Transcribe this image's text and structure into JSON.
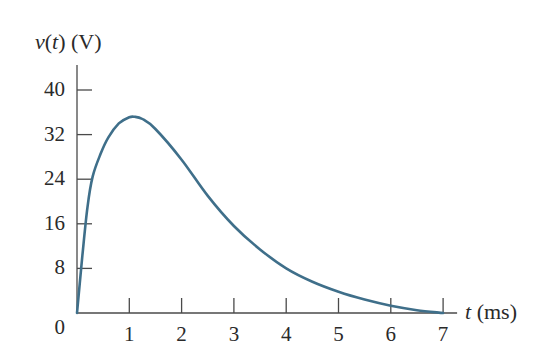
{
  "chart_data": {
    "type": "line",
    "title": "",
    "ylabel": "v(t) (V)",
    "ylabel_var": "v",
    "ylabel_arg": "t",
    "ylabel_unit": "(V)",
    "xlabel": "t (ms)",
    "xlabel_var": "t",
    "xlabel_unit": "(ms)",
    "xlim": [
      0,
      7
    ],
    "ylim": [
      0,
      40
    ],
    "xticks": [
      1,
      2,
      3,
      4,
      5,
      6,
      7
    ],
    "xtick_labels": [
      "1",
      "2",
      "3",
      "4",
      "5",
      "6",
      "7"
    ],
    "yticks": [
      0,
      8,
      16,
      24,
      32,
      40
    ],
    "ytick_labels": [
      "0",
      "8",
      "16",
      "24",
      "32",
      "40"
    ],
    "origin_label": "0",
    "grid": false,
    "legend": null,
    "series": [
      {
        "name": "v(t)",
        "color": "#3f6f8a",
        "x": [
          0,
          0.1,
          0.2,
          0.3,
          0.45,
          0.6,
          0.8,
          1.0,
          1.1,
          1.25,
          1.5,
          2.0,
          2.5,
          3.0,
          3.5,
          4.0,
          4.5,
          5.0,
          5.5,
          6.0,
          6.5,
          7.0
        ],
        "y": [
          0,
          10,
          19,
          24.5,
          28.5,
          31.5,
          34,
          35.1,
          35.2,
          34.8,
          33,
          27.5,
          21,
          15.6,
          11.4,
          8.0,
          5.6,
          3.8,
          2.4,
          1.3,
          0.5,
          0
        ]
      }
    ]
  },
  "colors": {
    "curve": "#3f6f8a",
    "axis": "#4a4a4a",
    "text": "#2a2a2a"
  }
}
